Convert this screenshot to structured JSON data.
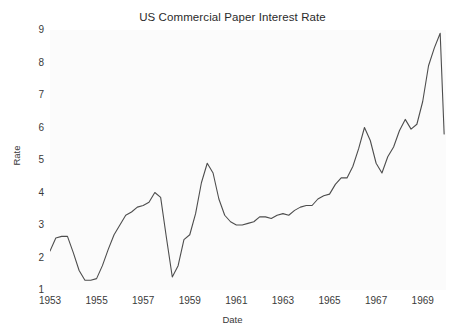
{
  "chart_data": {
    "type": "line",
    "title": "US Commercial Paper Interest Rate",
    "xlabel": "Date",
    "ylabel": "Rate",
    "xlim": [
      1953.0,
      1970.0
    ],
    "ylim": [
      1.0,
      9.0
    ],
    "xticks": [
      1953,
      1955,
      1957,
      1959,
      1961,
      1963,
      1965,
      1967,
      1969
    ],
    "xtick_labels": [
      "1953",
      "1955",
      "1957",
      "1959",
      "1961",
      "1963",
      "1965",
      "1967",
      "1969"
    ],
    "yticks": [
      1,
      2,
      3,
      4,
      5,
      6,
      7,
      8,
      9
    ],
    "ytick_labels": [
      "1",
      "2",
      "3",
      "4",
      "5",
      "6",
      "7",
      "8",
      "9"
    ],
    "grid": false,
    "legend": null,
    "line_color": "#4d4d4d",
    "line_width": 1.1,
    "plot_background": "#fbfbfb",
    "figure_background": "#ffffff",
    "series": [
      {
        "name": "Commercial Paper Rate",
        "x": [
          1953.0,
          1953.25,
          1953.5,
          1953.75,
          1954.0,
          1954.25,
          1954.5,
          1954.75,
          1955.0,
          1955.25,
          1955.5,
          1955.75,
          1956.0,
          1956.25,
          1956.5,
          1956.75,
          1957.0,
          1957.25,
          1957.5,
          1957.75,
          1958.0,
          1958.25,
          1958.5,
          1958.75,
          1959.0,
          1959.25,
          1959.5,
          1959.75,
          1960.0,
          1960.25,
          1960.5,
          1960.75,
          1961.0,
          1961.25,
          1961.5,
          1961.75,
          1962.0,
          1962.25,
          1962.5,
          1962.75,
          1963.0,
          1963.25,
          1963.5,
          1963.75,
          1964.0,
          1964.25,
          1964.5,
          1964.75,
          1965.0,
          1965.25,
          1965.5,
          1965.75,
          1966.0,
          1966.25,
          1966.5,
          1966.75,
          1967.0,
          1967.25,
          1967.5,
          1967.75,
          1968.0,
          1968.25,
          1968.5,
          1968.75,
          1969.0,
          1969.25,
          1969.5,
          1969.75,
          1969.92
        ],
        "y": [
          2.2,
          2.6,
          2.65,
          2.65,
          2.15,
          1.6,
          1.3,
          1.3,
          1.35,
          1.75,
          2.25,
          2.7,
          3.0,
          3.3,
          3.4,
          3.55,
          3.6,
          3.7,
          4.0,
          3.85,
          2.6,
          1.4,
          1.75,
          2.55,
          2.7,
          3.35,
          4.3,
          4.9,
          4.6,
          3.8,
          3.3,
          3.1,
          3.0,
          3.0,
          3.05,
          3.1,
          3.25,
          3.25,
          3.2,
          3.3,
          3.35,
          3.3,
          3.45,
          3.55,
          3.6,
          3.6,
          3.8,
          3.9,
          3.95,
          4.25,
          4.45,
          4.45,
          4.8,
          5.35,
          6.0,
          5.6,
          4.9,
          4.6,
          5.1,
          5.4,
          5.9,
          6.25,
          5.95,
          6.1,
          6.8,
          7.9,
          8.45,
          8.9,
          5.8
        ]
      }
    ],
    "annotations": []
  },
  "figure": {
    "title": "US Commercial Paper Interest Rate"
  }
}
